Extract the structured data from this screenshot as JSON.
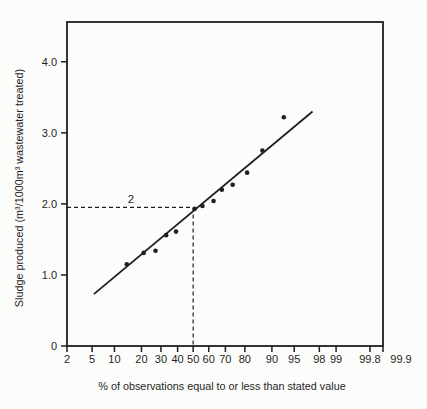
{
  "figure": {
    "background": "#fcfcfb",
    "ink_color": "#1f1f1f"
  },
  "chart_data": {
    "type": "scatter",
    "title": "",
    "xlabel": "% of observations equal to or less than stated value",
    "ylabel": "Sludge produced (m³/1000m³ wastewater treated)",
    "x_scale": "normal-probability",
    "xlim": [
      2,
      99.9
    ],
    "ylim": [
      0,
      4.56
    ],
    "grid": false,
    "legend": null,
    "x_ticks": [
      2,
      5,
      10,
      20,
      30,
      40,
      50,
      60,
      70,
      80,
      90,
      95,
      98,
      99,
      99.8,
      99.9
    ],
    "x_tick_labels": [
      "2",
      "5",
      "10",
      "20",
      "30",
      "40",
      "50",
      "60",
      "70",
      "80",
      "90",
      "95",
      "98",
      "99",
      "99.8",
      "99.9"
    ],
    "y_ticks": [
      0,
      1,
      2,
      3,
      4
    ],
    "y_tick_labels": [
      "0",
      "1.0",
      "2.0",
      "3.0",
      "4.0"
    ],
    "points": [
      {
        "pct": 14,
        "value": 1.15
      },
      {
        "pct": 21,
        "value": 1.31
      },
      {
        "pct": 27,
        "value": 1.34
      },
      {
        "pct": 33,
        "value": 1.56
      },
      {
        "pct": 39,
        "value": 1.61
      },
      {
        "pct": 51,
        "value": 1.93
      },
      {
        "pct": 56,
        "value": 1.97
      },
      {
        "pct": 63,
        "value": 2.04
      },
      {
        "pct": 68,
        "value": 2.2
      },
      {
        "pct": 74,
        "value": 2.27
      },
      {
        "pct": 81,
        "value": 2.44
      },
      {
        "pct": 87,
        "value": 2.75
      },
      {
        "pct": 93,
        "value": 3.22
      }
    ],
    "trend_line": {
      "from": {
        "pct": 5.3,
        "value": 0.73
      },
      "to": {
        "pct": 97.4,
        "value": 3.3
      }
    },
    "median_guide": {
      "pct": 50,
      "value": 1.95,
      "label": "2"
    }
  }
}
